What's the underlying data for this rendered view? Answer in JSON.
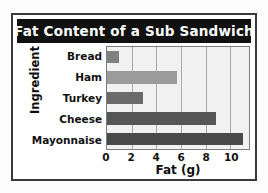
{
  "chart_data": {
    "type": "bar",
    "orientation": "horizontal",
    "title": "Fat Content of a Sub Sandwich",
    "xlabel": "Fat (g)",
    "ylabel": "Ingredient",
    "categories": [
      "Bread",
      "Ham",
      "Turkey",
      "Cheese",
      "Mayonnaise"
    ],
    "values": [
      1,
      5.7,
      2.9,
      8.8,
      11
    ],
    "bar_colors": [
      "#808080",
      "#9b9b9b",
      "#6b6b6b",
      "#555555",
      "#4a4a4a"
    ],
    "xlim": [
      0,
      11.5
    ],
    "xticks": [
      0,
      2,
      4,
      6,
      8,
      10
    ],
    "xtick_labels": [
      "0",
      "2",
      "4",
      "6",
      "8",
      "10"
    ],
    "grid": true,
    "grid_axis": "x",
    "legend": false
  },
  "style": {
    "title_bg": "#111111",
    "title_color": "#ffffff",
    "plot_bg": "#f1f1f1",
    "grid_color": "#a9a9a9",
    "frame_color": "#3a3a3a",
    "page_bg": "#ffffff"
  }
}
